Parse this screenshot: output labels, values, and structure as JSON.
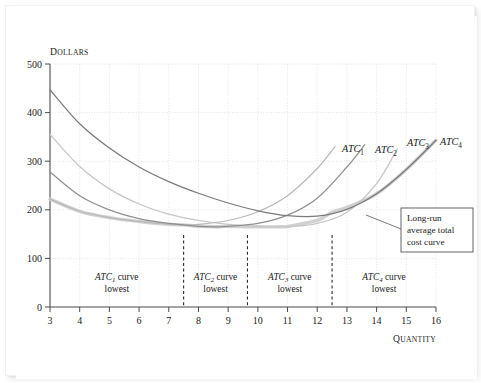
{
  "chart_data": {
    "type": "line",
    "title": "",
    "xlabel": "QUANTITY",
    "ylabel": "DOLLARS",
    "xlim": [
      3,
      16
    ],
    "ylim": [
      0,
      500
    ],
    "grid": true,
    "legend_position": "inline-curve-end-labels",
    "x_ticks": [
      "3",
      "4",
      "5",
      "6",
      "7",
      "8",
      "9",
      "10",
      "11",
      "12",
      "13",
      "14",
      "15",
      "16"
    ],
    "y_ticks": [
      "0",
      "100",
      "200",
      "300",
      "400",
      "500"
    ],
    "series": [
      {
        "name": "ATC1",
        "label": "ATC",
        "subscript": "1",
        "color": "#b9b9b9",
        "x": [
          3,
          4,
          5,
          6,
          7,
          7.5,
          8,
          9,
          10,
          11,
          12,
          12.6
        ],
        "values": [
          222,
          197,
          184,
          176,
          170,
          169,
          170,
          178,
          196,
          229,
          285,
          330
        ]
      },
      {
        "name": "ATC2",
        "label": "ATC",
        "subscript": "2",
        "color": "#8f8f8f",
        "x": [
          3,
          4,
          5,
          6,
          7,
          8,
          8.6,
          9,
          10,
          11,
          12,
          13,
          13.6
        ],
        "values": [
          278,
          229,
          200,
          182,
          172,
          166,
          165,
          166,
          172,
          189,
          224,
          288,
          334
        ]
      },
      {
        "name": "ATC3",
        "label": "ATC",
        "subscript": "3",
        "color": "#c6c6c6",
        "x": [
          3,
          4,
          5,
          6,
          7,
          8,
          9,
          10,
          10.8,
          11,
          12,
          13,
          14,
          14.7
        ],
        "values": [
          355,
          289,
          243,
          212,
          191,
          178,
          170,
          166,
          165,
          165,
          172,
          195,
          254,
          326
        ]
      },
      {
        "name": "ATC4",
        "label": "ATC",
        "subscript": "4",
        "color": "#7b7b7b",
        "x": [
          3,
          4,
          5,
          6,
          7,
          8,
          9,
          10,
          11,
          12,
          13,
          14,
          15,
          16
        ],
        "values": [
          447,
          377,
          327,
          288,
          258,
          234,
          214,
          198,
          188,
          187,
          201,
          233,
          283,
          343
        ]
      },
      {
        "name": "LRATC",
        "label": "Long-run average total cost curve",
        "subscript": "",
        "color": "#cfcfcf",
        "x": [
          3,
          4,
          5,
          6,
          7,
          7.5,
          8,
          8.6,
          9,
          9.65,
          10,
          10.8,
          11,
          12,
          12.5,
          13,
          14,
          15,
          16
        ],
        "values": [
          222,
          197,
          184,
          176,
          170,
          169,
          166,
          165,
          166,
          165,
          165,
          165,
          166,
          178,
          195,
          205,
          233,
          283,
          343
        ]
      }
    ],
    "dashed_dividers": [
      7.5,
      9.65,
      12.5
    ],
    "curve_end_labels": [
      {
        "name": "ATC1",
        "text": "ATC",
        "sub": "1",
        "x_px": 337,
        "y_px": 136
      },
      {
        "name": "ATC2",
        "text": "ATC",
        "sub": "2",
        "x_px": 370,
        "y_px": 137
      },
      {
        "name": "ATC3",
        "text": "ATC",
        "sub": "3",
        "x_px": 402,
        "y_px": 130
      },
      {
        "name": "ATC4",
        "text": "ATC",
        "sub": "4",
        "x_px": 435,
        "y_px": 129
      }
    ],
    "region_labels": [
      {
        "name": "region-atc1",
        "line1_prefix": "ATC",
        "line1_sub": "1",
        "line1_suffix": " curve",
        "line2": "lowest"
      },
      {
        "name": "region-atc2",
        "line1_prefix": "ATC",
        "line1_sub": "2",
        "line1_suffix": " curve",
        "line2": "lowest"
      },
      {
        "name": "region-atc3",
        "line1_prefix": "ATC",
        "line1_sub": "3",
        "line1_suffix": " curve",
        "line2": "lowest"
      },
      {
        "name": "region-atc4",
        "line1_prefix": "ATC",
        "line1_sub": "4",
        "line1_suffix": " curve",
        "line2": "lowest"
      }
    ],
    "callout": {
      "line1": "Long-run",
      "line2": "average total",
      "line3": "cost curve"
    }
  },
  "axes": {
    "y_title": "DOLLARS",
    "y_title_first": "D",
    "y_title_rest": "OLLARS",
    "x_title": "QUANTITY",
    "x_title_first": "Q",
    "x_title_rest": "UANTITY"
  },
  "colors": {
    "axis": "#4a4a4a",
    "grid": "#d8d8d8",
    "text": "#1b1b1b",
    "callout_border": "#555555",
    "atc1": "#b9b9b9",
    "atc2": "#8f8f8f",
    "atc3": "#c6c6c6",
    "atc4": "#7b7b7b",
    "lratc": "#cfcfcf"
  }
}
